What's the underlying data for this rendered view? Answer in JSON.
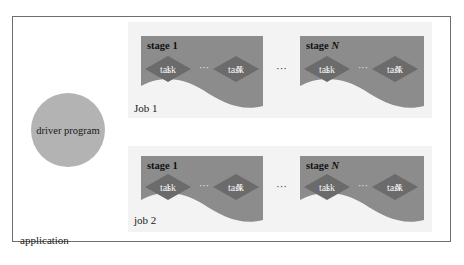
{
  "application": {
    "label": "application"
  },
  "driver": {
    "label": "driver program",
    "color": "#b3b3b3"
  },
  "colors": {
    "stage": "#8c8c8c",
    "task": "#6b6b6b",
    "job_bg": "#f3f3f3"
  },
  "jobs": [
    {
      "label": "Job 1",
      "stages": [
        {
          "label_prefix": "stage",
          "label_suffix": "1",
          "suffix_italic": false,
          "tasks": [
            {
              "prefix": "task",
              "suffix": "1"
            },
            {
              "prefix": "task",
              "suffix": "N"
            }
          ],
          "ellipsis": "···"
        },
        {
          "label_prefix": "stage",
          "label_suffix": "N",
          "suffix_italic": true,
          "tasks": [
            {
              "prefix": "task",
              "suffix": "1"
            },
            {
              "prefix": "task",
              "suffix": "N"
            }
          ],
          "ellipsis": "···"
        }
      ],
      "between_ellipsis": "···"
    },
    {
      "label": "job 2",
      "stages": [
        {
          "label_prefix": "stage",
          "label_suffix": "1",
          "suffix_italic": false,
          "tasks": [
            {
              "prefix": "task",
              "suffix": "1"
            },
            {
              "prefix": "task",
              "suffix": "N"
            }
          ],
          "ellipsis": "···"
        },
        {
          "label_prefix": "stage",
          "label_suffix": "N",
          "suffix_italic": true,
          "tasks": [
            {
              "prefix": "task",
              "suffix": "1"
            },
            {
              "prefix": "task",
              "suffix": "N"
            }
          ],
          "ellipsis": "···"
        }
      ],
      "between_ellipsis": "···"
    }
  ]
}
